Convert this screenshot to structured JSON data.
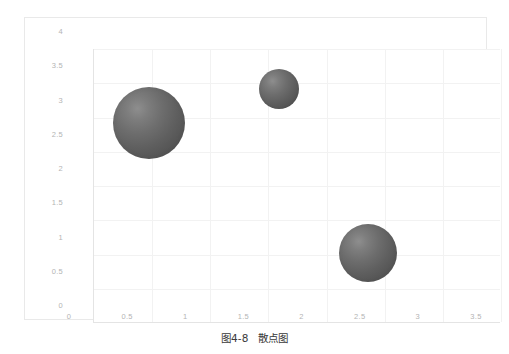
{
  "figure": {
    "caption_label": "图4-8",
    "caption_title": "散点图"
  },
  "chart_data": {
    "type": "scatter",
    "title": "",
    "xlabel": "",
    "ylabel": "",
    "xlim": [
      0,
      3.5
    ],
    "ylim": [
      0,
      4
    ],
    "grid": true,
    "legend": "none",
    "xticks": [
      "0",
      "0.5",
      "1",
      "1.5",
      "2",
      "2.5",
      "3",
      "3.5"
    ],
    "xtick_values": [
      0,
      0.5,
      1,
      1.5,
      2,
      2.5,
      3,
      3.5
    ],
    "yticks": [
      "0",
      "0.5",
      "1",
      "1.5",
      "2",
      "2.5",
      "3",
      "3.5",
      "4"
    ],
    "ytick_values": [
      0,
      0.5,
      1,
      1.5,
      2,
      2.5,
      3,
      3.5,
      4
    ],
    "marker_color": "#5f5f5f",
    "series": [
      {
        "name": "bubbles",
        "points": [
          {
            "x": 0.69,
            "y": 2.67,
            "size": 36
          },
          {
            "x": 1.81,
            "y": 3.17,
            "size": 20
          },
          {
            "x": 2.57,
            "y": 0.78,
            "size": 29
          }
        ]
      }
    ]
  }
}
